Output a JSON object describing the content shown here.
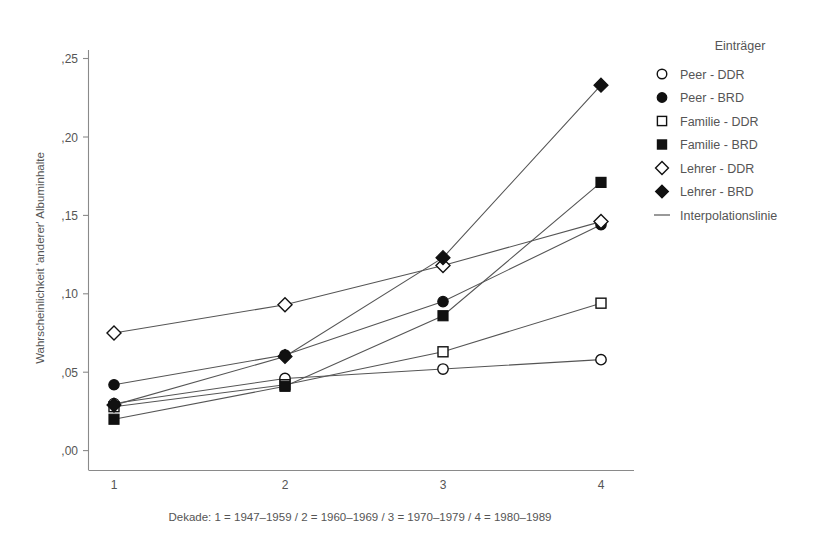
{
  "chart_data": {
    "type": "line",
    "title": "",
    "subtitle": "",
    "xlabel": "Dekade: 1 = 1947–1959 / 2 = 1960–1969 / 3 = 1970–1979 / 4 = 1980–1989",
    "ylabel": "Wahrscheinlichkeit 'anderer' Albuminhalte",
    "x": [
      1,
      2,
      3,
      4
    ],
    "categories": [
      "1",
      "2",
      "3",
      "4"
    ],
    "xtick_labels": [
      "1",
      "2",
      "3",
      "4"
    ],
    "ytick_labels": [
      ",00",
      ",05",
      ",10",
      ",15",
      ",20",
      ",25"
    ],
    "ytick_values": [
      0.0,
      0.05,
      0.1,
      0.15,
      0.2,
      0.25
    ],
    "xlim": [
      0.72,
      4.3
    ],
    "ylim": [
      0.0,
      0.262
    ],
    "grid": false,
    "legend_position": "right",
    "legend_title": "Einträger",
    "series": [
      {
        "name": "Peer - DDR",
        "marker": "circle-open",
        "values": [
          0.03,
          0.046,
          0.052,
          0.058
        ]
      },
      {
        "name": "Peer - BRD",
        "marker": "circle-filled",
        "values": [
          0.042,
          0.061,
          0.095,
          0.144
        ]
      },
      {
        "name": "Familie - DDR",
        "marker": "square-open",
        "values": [
          0.028,
          0.042,
          0.063,
          0.094
        ]
      },
      {
        "name": "Familie - BRD",
        "marker": "square-filled",
        "values": [
          0.02,
          0.041,
          0.086,
          0.171
        ]
      },
      {
        "name": "Lehrer - DDR",
        "marker": "diamond-open",
        "values": [
          0.075,
          0.093,
          0.118,
          0.146
        ]
      },
      {
        "name": "Lehrer - BRD",
        "marker": "diamond-filled",
        "values": [
          0.029,
          0.06,
          0.123,
          0.233
        ]
      }
    ]
  },
  "legend": {
    "title": "Einträger",
    "entries": [
      {
        "label": "Peer - DDR",
        "marker": "circle-open-icon"
      },
      {
        "label": "Peer - BRD",
        "marker": "circle-filled-icon"
      },
      {
        "label": "Familie - DDR",
        "marker": "square-open-icon"
      },
      {
        "label": "Familie - BRD",
        "marker": "square-filled-icon"
      },
      {
        "label": "Lehrer - DDR",
        "marker": "diamond-open-icon"
      },
      {
        "label": "Lehrer - BRD",
        "marker": "diamond-filled-icon"
      },
      {
        "label": "Interpolationslinie",
        "marker": "line-icon"
      }
    ]
  },
  "axes": {
    "y_title": "Wahrscheinlichkeit 'anderer' Albuminhalte",
    "x_title": "Dekade: 1 = 1947–1959 / 2 = 1960–1969 / 3 = 1970–1979 / 4 = 1980–1989",
    "y_ticks": [
      ",25",
      ",20",
      ",15",
      ",10",
      ",05",
      ",00"
    ],
    "x_ticks": [
      "1",
      "2",
      "3",
      "4"
    ]
  },
  "colors": {
    "marker_fill": "#111111",
    "marker_open": "#ffffff",
    "line": "#555555",
    "axis": "#8a8a8a",
    "text": "#555555",
    "background": "#ffffff"
  }
}
